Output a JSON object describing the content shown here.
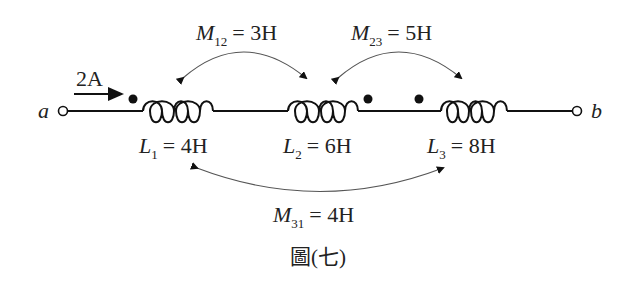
{
  "figure": {
    "caption": "圖(七)",
    "terminals": {
      "left": "a",
      "right": "b"
    },
    "current": {
      "value": "2A"
    },
    "inductors": [
      {
        "symbol": "L",
        "sub": "1",
        "value": "= 4H"
      },
      {
        "symbol": "L",
        "sub": "2",
        "value": "= 6H"
      },
      {
        "symbol": "L",
        "sub": "3",
        "value": "= 8H"
      }
    ],
    "mutuals": [
      {
        "symbol": "M",
        "sub": "12",
        "value": "= 3H"
      },
      {
        "symbol": "M",
        "sub": "23",
        "value": "= 5H"
      },
      {
        "symbol": "M",
        "sub": "31",
        "value": "= 4H"
      }
    ]
  }
}
